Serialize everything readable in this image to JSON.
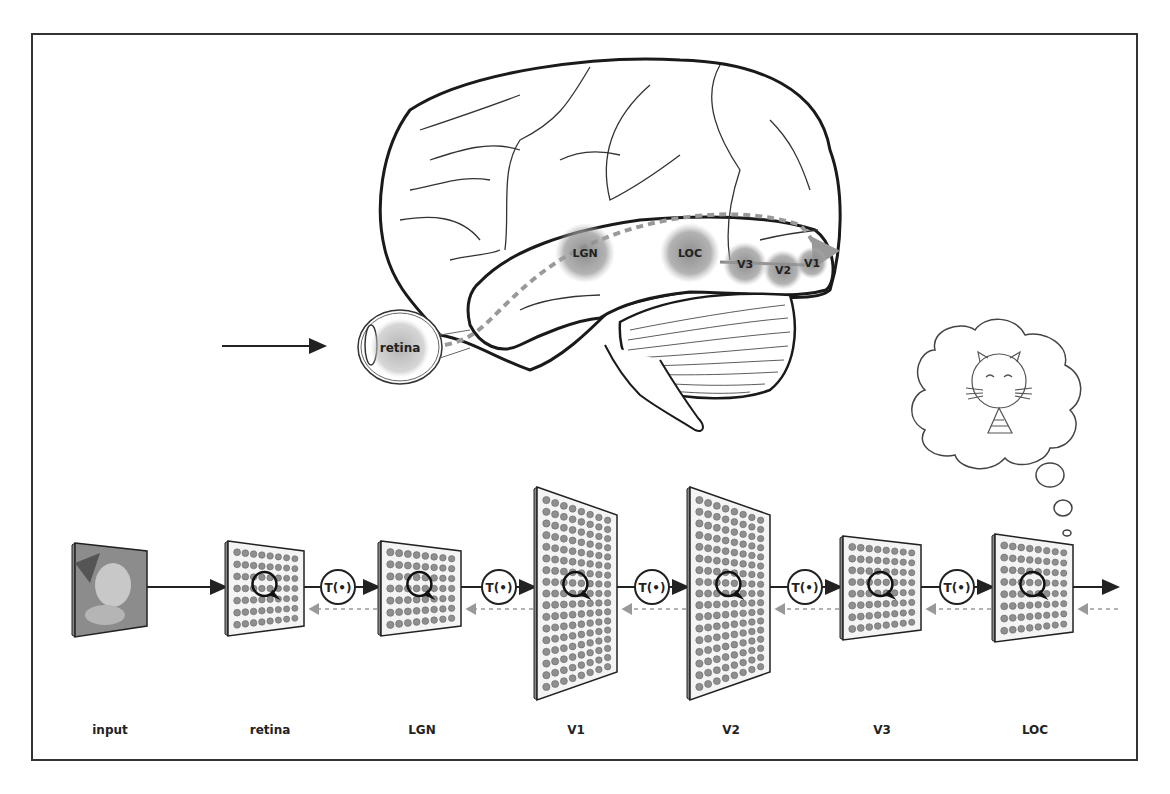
{
  "figure": {
    "brain": {
      "regions": [
        {
          "id": "retina",
          "label": "retina",
          "cx": 400,
          "cy": 348,
          "r": 30
        },
        {
          "id": "lgn",
          "label": "LGN",
          "cx": 585,
          "cy": 253,
          "r": 30
        },
        {
          "id": "loc",
          "label": "LOC",
          "cx": 690,
          "cy": 253,
          "r": 30
        },
        {
          "id": "v3",
          "label": "V3",
          "cx": 745,
          "cy": 264,
          "r": 22
        },
        {
          "id": "v2",
          "label": "V2",
          "cx": 783,
          "cy": 270,
          "r": 20
        },
        {
          "id": "v1",
          "label": "V1",
          "cx": 812,
          "cy": 263,
          "r": 16
        }
      ],
      "pathway_description": "dashed gray arrow from retina through LGN to V1, then feedforward V1 to V3 to LOC"
    },
    "input_arrow": {
      "from_x": 222,
      "to_x": 325,
      "y": 346
    },
    "thought_bubble": {
      "content": "cat-drawing"
    },
    "pipeline": {
      "stages": [
        {
          "id": "input",
          "label": "input",
          "x": 75,
          "w": 72,
          "top": 543,
          "bottom": 637,
          "rtop": 551,
          "rbottom": 626,
          "type": "image"
        },
        {
          "id": "retina",
          "label": "retina",
          "x": 228,
          "w": 76,
          "top": 541,
          "bottom": 636,
          "rtop": 551,
          "rbottom": 626,
          "type": "grid",
          "cols": 8,
          "rows": 7
        },
        {
          "id": "lgn",
          "label": "LGN",
          "x": 381,
          "w": 80,
          "top": 541,
          "bottom": 636,
          "rtop": 551,
          "rbottom": 626,
          "type": "grid",
          "cols": 8,
          "rows": 7
        },
        {
          "id": "v1",
          "label": "V1",
          "x": 537,
          "w": 80,
          "top": 487,
          "bottom": 700,
          "rtop": 515,
          "rbottom": 672,
          "type": "grid",
          "cols": 8,
          "rows": 17
        },
        {
          "id": "v2",
          "label": "V2",
          "x": 690,
          "w": 80,
          "top": 487,
          "bottom": 700,
          "rtop": 515,
          "rbottom": 672,
          "type": "grid",
          "cols": 8,
          "rows": 17
        },
        {
          "id": "v3",
          "label": "V3",
          "x": 843,
          "w": 78,
          "top": 536,
          "bottom": 640,
          "rtop": 545,
          "rbottom": 630,
          "type": "grid",
          "cols": 8,
          "rows": 8
        },
        {
          "id": "loc",
          "label": "LOC",
          "x": 995,
          "w": 78,
          "top": 534,
          "bottom": 642,
          "rtop": 545,
          "rbottom": 632,
          "type": "grid",
          "cols": 8,
          "rows": 8
        }
      ],
      "transforms": [
        {
          "label": "T(•)",
          "cx": 338
        },
        {
          "label": "T(•)",
          "cx": 499
        },
        {
          "label": "T(•)",
          "cx": 652
        },
        {
          "label": "T(•)",
          "cx": 805
        },
        {
          "label": "T(•)",
          "cx": 957
        }
      ],
      "forward_y": 587,
      "feedback_y": 609,
      "output_arrow_end_x": 1118
    },
    "labels": [
      {
        "text": "input",
        "x": 110
      },
      {
        "text": "retina",
        "x": 270
      },
      {
        "text": "LGN",
        "x": 422
      },
      {
        "text": "V1",
        "x": 576
      },
      {
        "text": "V2",
        "x": 731
      },
      {
        "text": "V3",
        "x": 882
      },
      {
        "text": "LOC",
        "x": 1035
      }
    ],
    "colors": {
      "line": "#222222",
      "region_fill": "#8a8a8a",
      "node_fill": "#8f8f8f",
      "panel_fill": "#f4f4f4",
      "dash": "#999999"
    }
  }
}
